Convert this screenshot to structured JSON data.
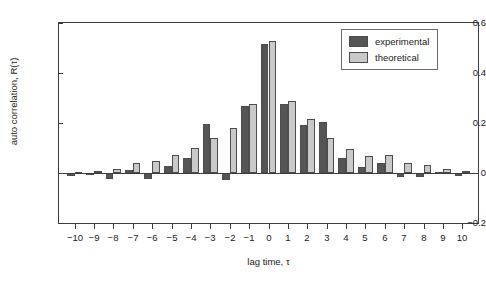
{
  "chart_data": {
    "type": "bar",
    "title": "",
    "xlabel": "lag time, τ",
    "ylabel": "auto correlation, R(τ)",
    "xlim": [
      -10.8,
      10.8
    ],
    "ylim": [
      -0.2,
      0.6
    ],
    "grid": false,
    "legend_position": "top-right",
    "ytick_labels": [
      "0.6",
      "0.4",
      "0.2",
      "0",
      "-0.2"
    ],
    "ytick_values": [
      0.6,
      0.4,
      0.2,
      0,
      -0.2
    ],
    "categories": [
      -10,
      -9,
      -8,
      -7,
      -6,
      -5,
      -4,
      -3,
      -2,
      -1,
      0,
      1,
      2,
      3,
      4,
      5,
      6,
      7,
      8,
      9,
      10
    ],
    "xtick_labels": [
      "-10",
      "-9",
      "-8",
      "-7",
      "-6",
      "-5",
      "-4",
      "-3",
      "-2",
      "-1",
      "0",
      "1",
      "2",
      "3",
      "4",
      "5",
      "6",
      "7",
      "8",
      "9",
      "10"
    ],
    "series": [
      {
        "name": "experimental",
        "color": "#555555",
        "values": [
          -0.012,
          -0.004,
          -0.022,
          0.012,
          -0.022,
          0.028,
          0.06,
          0.196,
          -0.028,
          0.268,
          0.518,
          0.278,
          0.192,
          0.205,
          0.06,
          0.026,
          0.042,
          -0.014,
          -0.016,
          0.004,
          -0.01
        ]
      },
      {
        "name": "theoretical",
        "color": "#c9c9c9",
        "values": [
          0.006,
          0.01,
          0.018,
          0.042,
          0.05,
          0.072,
          0.1,
          0.14,
          0.182,
          0.278,
          0.53,
          0.29,
          0.216,
          0.14,
          0.098,
          0.068,
          0.072,
          0.042,
          0.034,
          0.018,
          0.008
        ]
      }
    ]
  },
  "legend": {
    "items": [
      {
        "label": "experimental",
        "swatch": "#555555"
      },
      {
        "label": "theoretical",
        "swatch": "#c9c9c9"
      }
    ]
  }
}
